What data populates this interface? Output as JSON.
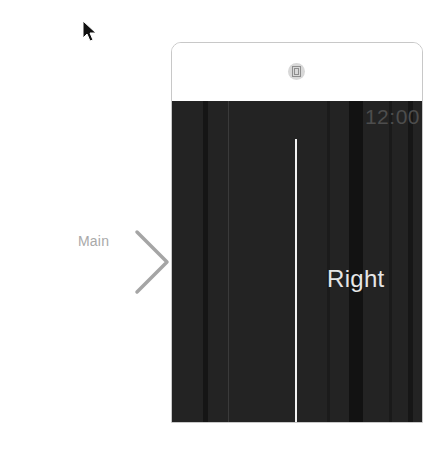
{
  "canvas": {
    "entry_point": {
      "label": "Main",
      "icon": "arrow-right-icon"
    },
    "cursor": {
      "icon": "pointer-arrow-icon"
    }
  },
  "scene": {
    "header": {
      "icon": "interface-controller-icon"
    },
    "screen": {
      "clock": "12:00",
      "label": "Right",
      "divider": "separator-line",
      "colors": {
        "background": "#232323",
        "clock": "#4d4d4d",
        "label": "#e6e6e6",
        "divider": "#f2f2f2"
      }
    }
  }
}
